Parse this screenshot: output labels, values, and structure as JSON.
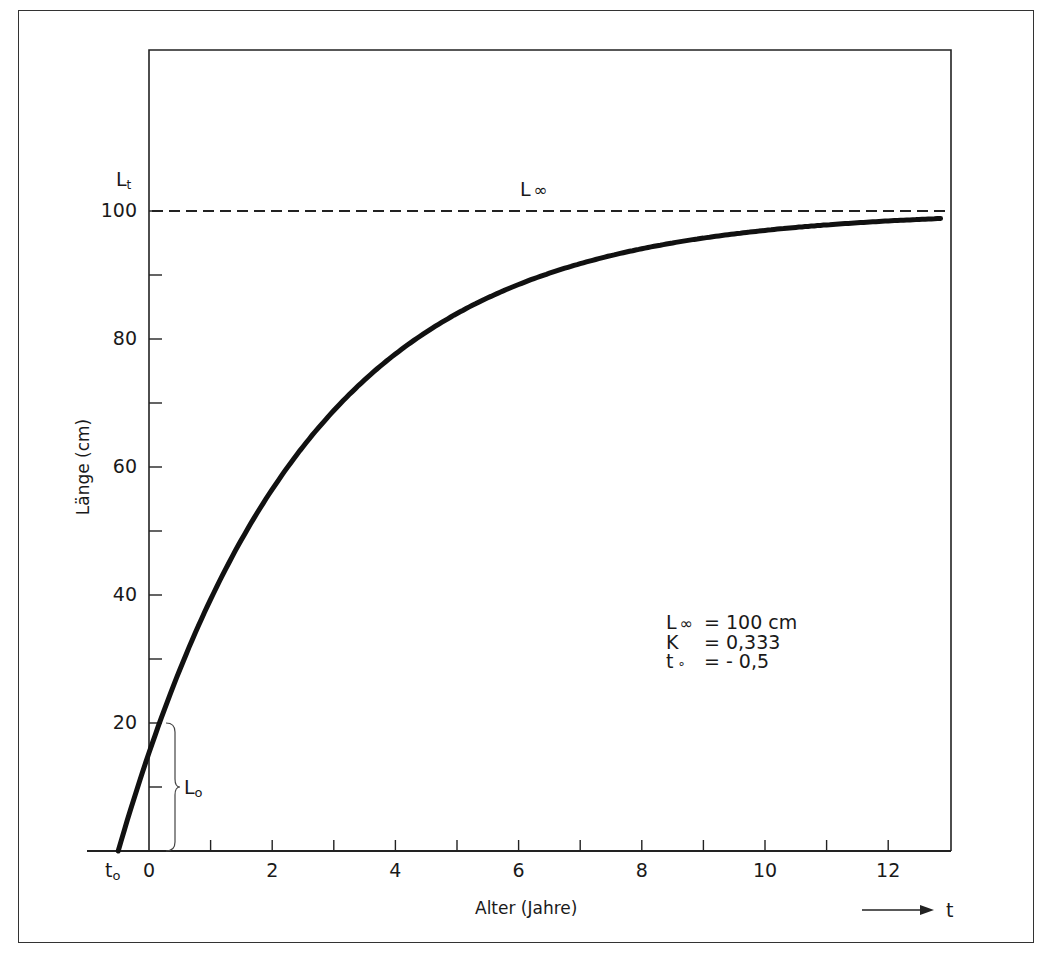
{
  "chart_data": {
    "type": "line",
    "title": "",
    "xlabel": "Alter (Jahre)",
    "ylabel": "Länge (cm)",
    "y_symbol": "Lt",
    "x_symbol": "t",
    "xlim": [
      -1.0,
      12.9
    ],
    "ylim": [
      0,
      120
    ],
    "grid": false,
    "x_major_ticks": [
      0,
      2,
      4,
      6,
      8,
      10,
      12
    ],
    "x_minor_ticks": [
      1,
      3,
      5,
      7,
      9,
      11
    ],
    "x_tick_labels": [
      "0",
      "2",
      "4",
      "6",
      "8",
      "10",
      "12"
    ],
    "y_major_ticks": [
      20,
      40,
      60,
      80,
      100
    ],
    "y_minor_ticks": [
      10,
      30,
      50,
      70,
      90
    ],
    "y_tick_labels": [
      "20",
      "40",
      "60",
      "80",
      "100"
    ],
    "series": [
      {
        "name": "von Bertalanffy growth curve",
        "style": "solid-thick",
        "formula": "L(t) = Linf * (1 - exp(-K * (t - t0)))",
        "x": [
          -0.5,
          0,
          1,
          2,
          3,
          4,
          5,
          6,
          7,
          8,
          9,
          10,
          11,
          12,
          12.85
        ],
        "y": [
          0,
          15.3,
          39.3,
          56.4,
          68.7,
          77.6,
          83.9,
          88.5,
          91.7,
          94.0,
          95.7,
          96.9,
          97.8,
          98.4,
          98.9
        ]
      },
      {
        "name": "L∞ asymptote",
        "style": "dashed",
        "x": [
          0,
          12.9
        ],
        "y": [
          100,
          100
        ]
      }
    ],
    "annotations": [
      {
        "text": "L∞",
        "x": 5.6,
        "y": 104,
        "target": "asymptote label"
      },
      {
        "text": "L0",
        "x": 0.55,
        "y": 10,
        "target": "brace spanning 0–20 at t=0"
      },
      {
        "text": "t0",
        "x": -0.6,
        "y": -3,
        "target": "x-axis origin of curve"
      }
    ],
    "parameters": [
      {
        "symbol": "L∞",
        "value": "= 100 cm"
      },
      {
        "symbol": "K",
        "value": "= 0,333"
      },
      {
        "symbol": "t0",
        "value": "= - 0,5"
      }
    ]
  },
  "labels": {
    "y_symbol_main": "L",
    "y_symbol_sub": "t",
    "asymptote_main": "L",
    "asymptote_sub": "∞",
    "l0_main": "L",
    "l0_sub": "o",
    "t0_main": "t",
    "t0_sub": "o",
    "x_arrow_symbol": "t"
  },
  "params_box": {
    "rows": [
      {
        "main": "L",
        "sub": "∞",
        "value": "= 100 cm"
      },
      {
        "main": "K",
        "sub": "",
        "value": "= 0,333"
      },
      {
        "main": "t",
        "sub": "∘",
        "value": "= - 0,5"
      }
    ]
  }
}
